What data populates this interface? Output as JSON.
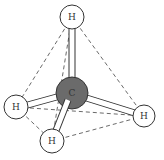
{
  "diagram": {
    "title": "",
    "molecule": "methane tetrahedral model",
    "atoms": {
      "carbon": {
        "label": "C",
        "x": 72,
        "y": 93,
        "r": 16,
        "color": "#6b6b6b"
      },
      "h_top": {
        "label": "H",
        "x": 72,
        "y": 17,
        "r": 12
      },
      "h_left": {
        "label": "H",
        "x": 16,
        "y": 107,
        "r": 12
      },
      "h_bottom": {
        "label": "H",
        "x": 52,
        "y": 141,
        "r": 12
      },
      "h_right": {
        "label": "H",
        "x": 144,
        "y": 116,
        "r": 11
      }
    },
    "colors": {
      "hydrogen_fill": "#ffffff",
      "outline": "#333333",
      "carbon_fill": "#6b6b6b"
    }
  }
}
